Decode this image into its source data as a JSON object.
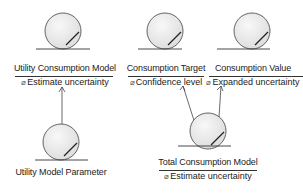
{
  "diagram": {
    "type": "UML entity class diagram",
    "nodes": [
      {
        "id": "utility-consumption-model",
        "label": "Utility Consumption Model",
        "operation": "Estimate uncertainty"
      },
      {
        "id": "consumption-target",
        "label": "Consumption Target",
        "operation": "Confidence level"
      },
      {
        "id": "consumption-value",
        "label": "Consumption Value",
        "operation": "Expanded uncertainty"
      },
      {
        "id": "utility-model-parameter",
        "label": "Utility Model Parameter"
      },
      {
        "id": "total-consumption-model",
        "label": "Total Consumption Model",
        "operation": "Estimate uncertainty"
      }
    ],
    "edges": [
      {
        "from": "utility-model-parameter",
        "to": "utility-consumption-model",
        "type": "arrow"
      },
      {
        "from": "total-consumption-model",
        "to": "consumption-target",
        "type": "arrow"
      },
      {
        "from": "total-consumption-model",
        "to": "consumption-value",
        "type": "arrow"
      }
    ],
    "operation_icon": "operation-icon",
    "colors": {
      "entity_fill": "#ececec",
      "stroke": "#333333",
      "text": "#222222"
    }
  }
}
